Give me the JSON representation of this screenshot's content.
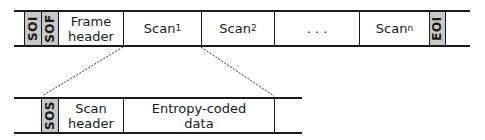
{
  "frame": {
    "segments": [
      {
        "label": "SOI",
        "type": "marker"
      },
      {
        "label": "SOF",
        "type": "marker"
      },
      {
        "label": "Frame header",
        "line1": "Frame",
        "line2": "header"
      },
      {
        "label": "Scan1",
        "base": "Scan",
        "sub": "1"
      },
      {
        "label": "Scan2",
        "base": "Scan",
        "sub": "2"
      },
      {
        "label": ". . ."
      },
      {
        "label": "Scann",
        "base": "Scan",
        "sub": "n"
      },
      {
        "label": "EOI",
        "type": "marker"
      }
    ]
  },
  "scan": {
    "segments": [
      {
        "label": "SOS",
        "type": "marker"
      },
      {
        "label": "Scan header",
        "line1": "Scan",
        "line2": "header"
      },
      {
        "label": "Entropy-coded data",
        "line1": "Entropy-coded",
        "line2": "data"
      }
    ]
  },
  "colors": {
    "marker_fill": "#c8c8c8",
    "line": "#1a1a1a"
  }
}
